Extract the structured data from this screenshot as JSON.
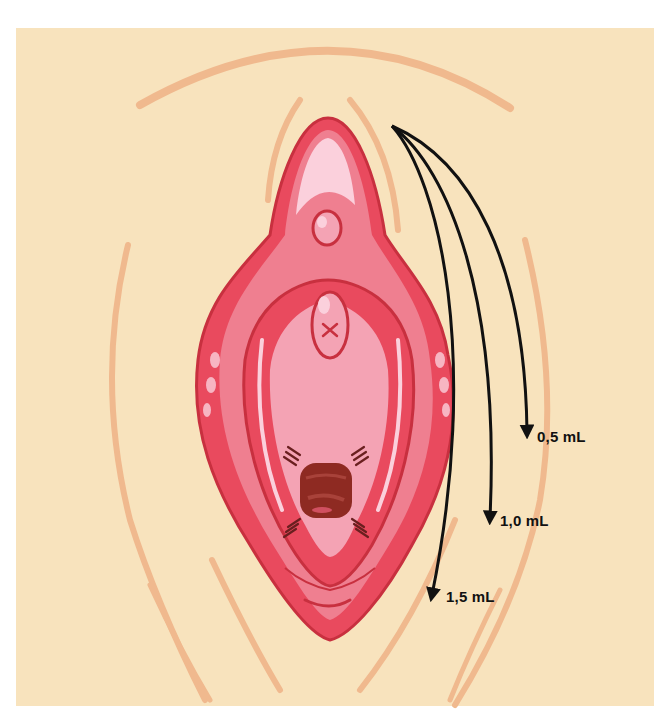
{
  "figure": {
    "type": "anatomical-injection-diagram",
    "colors": {
      "background": "#f8e3bd",
      "skin_lines": "#f0b98e",
      "outer_tissue": "#e94a5e",
      "mid_tissue": "#ef7f90",
      "inner_tissue": "#f4a3b4",
      "highlight": "#fbd0dc",
      "outline": "#c8303f",
      "opening": "#8e2a22",
      "arrows": "#111111"
    },
    "arrows": [
      {
        "label": "0,5 mL",
        "volume_ml": 0.5
      },
      {
        "label": "1,0 mL",
        "volume_ml": 1.0
      },
      {
        "label": "1,5 mL",
        "volume_ml": 1.5
      }
    ]
  }
}
